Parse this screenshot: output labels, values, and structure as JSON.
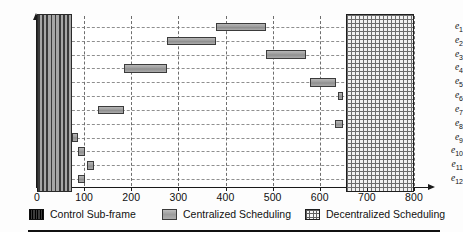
{
  "figure": {
    "y_axis_labels": [
      "e1",
      "e2",
      "e3",
      "e4",
      "e5",
      "e6",
      "e7",
      "e8",
      "e9",
      "e10",
      "e11",
      "e12"
    ],
    "y_axis_label_base": [
      "e",
      "e",
      "e",
      "e",
      "e",
      "e",
      "e",
      "e",
      "e",
      "e",
      "e",
      "e"
    ],
    "y_axis_label_sub": [
      "1",
      "2",
      "3",
      "4",
      "5",
      "6",
      "7",
      "8",
      "9",
      "10",
      "11",
      "12"
    ],
    "x_tick_labels": [
      "0",
      "100",
      "200",
      "300",
      "400",
      "500",
      "600",
      "700",
      "800"
    ]
  },
  "legend": {
    "items": [
      {
        "label": "Control Sub-frame",
        "swatch": "dark-striped-swatch-icon",
        "color": "#0d0d0d"
      },
      {
        "label": "Centralized Scheduling",
        "swatch": "gray-fill-swatch-icon",
        "color": "#9c9c9c"
      },
      {
        "label": "Decentralized Scheduling",
        "swatch": "cross-hatch-swatch-icon",
        "color": "#f4f4f4"
      }
    ]
  },
  "chart_data": {
    "type": "bar",
    "title": "",
    "xlabel": "",
    "ylabel": "",
    "orientation": "horizontal",
    "style": "gantt",
    "xlim": [
      0,
      800
    ],
    "xticks": [
      0,
      100,
      200,
      300,
      400,
      500,
      600,
      700,
      800
    ],
    "grid": true,
    "grid_style": "dashed",
    "legend_position": "bottom",
    "categories": [
      "e1",
      "e2",
      "e3",
      "e4",
      "e5",
      "e6",
      "e7",
      "e8",
      "e9",
      "e10",
      "e11",
      "e12"
    ],
    "spans": {
      "control_sub_frame": {
        "start": 0,
        "end": 75,
        "applies_to": "all_rows",
        "color": "#0d0d0d"
      },
      "decentralized_scheduling": {
        "start": 655,
        "end": 800,
        "applies_to": "all_rows",
        "color": "#f4f4f4"
      }
    },
    "series": [
      {
        "name": "Centralized Scheduling",
        "color": "#9c9c9c",
        "bars": [
          {
            "category": "e1",
            "start": 380,
            "end": 485,
            "duration": 105
          },
          {
            "category": "e2",
            "start": 275,
            "end": 380,
            "duration": 105
          },
          {
            "category": "e3",
            "start": 485,
            "end": 570,
            "duration": 85
          },
          {
            "category": "e4",
            "start": 185,
            "end": 275,
            "duration": 90
          },
          {
            "category": "e5",
            "start": 580,
            "end": 635,
            "duration": 55
          },
          {
            "category": "e6",
            "start": 638,
            "end": 650,
            "duration": 12
          },
          {
            "category": "e7",
            "start": 130,
            "end": 185,
            "duration": 55
          },
          {
            "category": "e8",
            "start": 633,
            "end": 650,
            "duration": 17
          },
          {
            "category": "e9",
            "start": 74,
            "end": 86,
            "duration": 12
          },
          {
            "category": "e10",
            "start": 88,
            "end": 101,
            "duration": 13
          },
          {
            "category": "e11",
            "start": 107,
            "end": 121,
            "duration": 14
          },
          {
            "category": "e12",
            "start": 88,
            "end": 101,
            "duration": 13
          }
        ]
      }
    ]
  }
}
